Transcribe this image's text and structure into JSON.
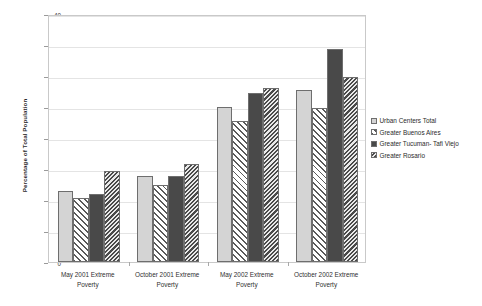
{
  "chart_data": {
    "type": "bar",
    "title": "",
    "xlabel": "",
    "ylabel": "Percentage of Total Population",
    "ylim": [
      0,
      40
    ],
    "ytick_step": 5,
    "yticks": [
      0,
      5,
      10,
      15,
      20,
      25,
      30,
      35,
      40
    ],
    "grid": true,
    "legend_position": "right",
    "categories": [
      "May 2001 Extreme Poverty",
      "October 2001 Extreme Poverty",
      "May 2002 Extreme Poverty",
      "October 2002 Extreme Poverty"
    ],
    "category_lines": [
      [
        "May 2001 Extreme",
        "Poverty"
      ],
      [
        "October 2001 Extreme",
        "Poverty"
      ],
      [
        "May 2002 Extreme",
        "Poverty"
      ],
      [
        "October 2002 Extreme",
        "Poverty"
      ]
    ],
    "series": [
      {
        "name": "Urban Centers Total",
        "pattern": "solid-light-gray",
        "color": "#d4d4d4",
        "values": [
          11.5,
          13.8,
          25.0,
          27.7
        ]
      },
      {
        "name": "Greater Buenos Aires",
        "pattern": "diagonal-hatch-forward",
        "color": "#ffffff",
        "values": [
          10.3,
          12.4,
          22.8,
          24.8
        ]
      },
      {
        "name": "Greater Tucuman- Tafi Viejo",
        "pattern": "solid-dark-gray",
        "color": "#494949",
        "values": [
          10.9,
          13.8,
          27.3,
          34.3
        ]
      },
      {
        "name": "Greater Rosario",
        "pattern": "dense-diagonal-hatch-backward",
        "color": "#4a4a4a",
        "values": [
          14.7,
          15.8,
          28.0,
          29.9
        ]
      }
    ]
  },
  "legend": {
    "entries": [
      "Urban Centers Total",
      "Greater Buenos Aires",
      "Greater Tucuman- Tafi Viejo",
      "Greater Rosario"
    ]
  }
}
